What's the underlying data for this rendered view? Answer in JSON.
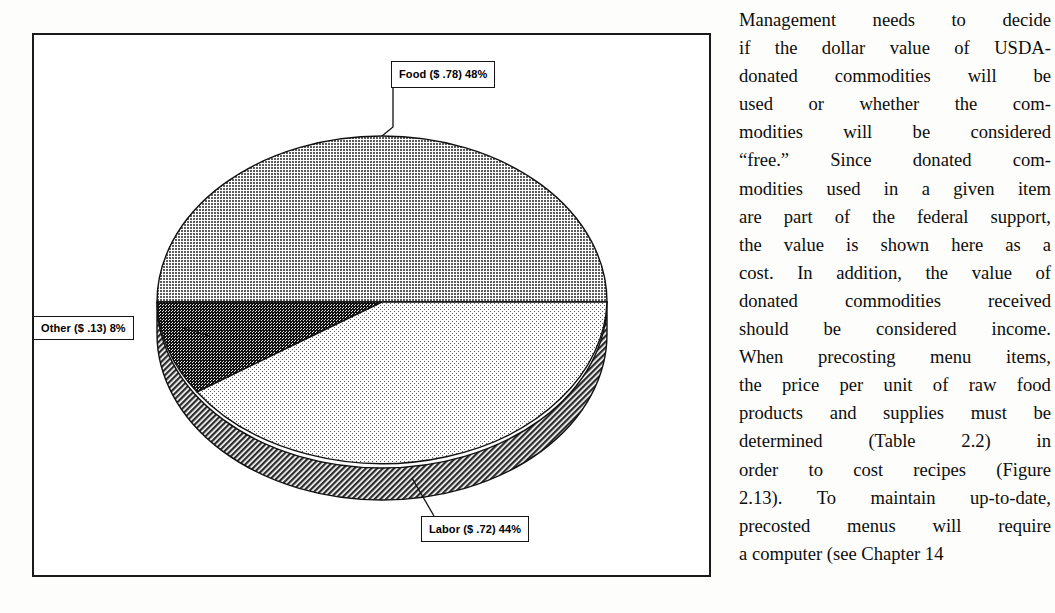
{
  "figure": {
    "frame_color": "#1a1a1a",
    "background": "#ffffff"
  },
  "chart_data": {
    "type": "pie",
    "title": "",
    "subtitle": "",
    "style": "3d-exploded-none",
    "categories": [
      "Food",
      "Labor",
      "Other"
    ],
    "values": [
      48,
      44,
      8
    ],
    "value_unit": "percent",
    "dollar_values": [
      "$ .78",
      "$ .72",
      "$ .13"
    ],
    "labels": [
      "Food ($ .78) 48%",
      "Labor ($ .72) 44%",
      "Other ($ .13) 8%"
    ],
    "slice_fills": {
      "food": "#9a9a9a",
      "labor": "#e2e2e2",
      "other": "#3a3a3a",
      "depth_wall": "#4a4a4a"
    },
    "legend": "none",
    "legend_position": "callout-labels",
    "grid": false,
    "annotations": [
      {
        "name": "food-callout",
        "text": "Food ($ .78) 48%"
      },
      {
        "name": "other-callout",
        "text": "Other ($ .13) 8%"
      },
      {
        "name": "labor-callout",
        "text": "Labor ($ .72) 44%"
      }
    ]
  },
  "callouts": {
    "food": "Food ($ .78) 48%",
    "other": "Other ($ .13) 8%",
    "labor": "Labor ($ .72) 44%"
  },
  "body_text": {
    "lines": [
      "Management needs to decide",
      "if the dollar value of USDA-",
      "donated commodities will be",
      "used or whether the com-",
      "modities will be considered",
      "“free.” Since donated com-",
      "modities used in a given item",
      "are part of the federal support,",
      "the value is shown here as a",
      "cost. In addition, the value of",
      "donated commodities received",
      "should be considered income.",
      "When precosting menu items,",
      "the price per unit of raw food",
      "products and supplies must be",
      "determined (Table 2.2) in",
      "order to cost recipes (Figure",
      "2.13). To maintain up-to-date,",
      "precosted menus will require",
      "a computer (see Chapter 14"
    ],
    "full_text": "Management needs to decide if the dollar value of USDA-donated commodities will be used or whether the commodities will be considered “free.” Since donated commodities used in a given item are part of the federal support, the value is shown here as a cost. In addition, the value of donated commodities received should be considered income. When precosting menu items, the price per unit of raw food products and supplies must be determined (Table 2.2) in order to cost recipes (Figure 2.13). To maintain up-to-date, precosted menus will require a computer (see Chapter 14"
  }
}
